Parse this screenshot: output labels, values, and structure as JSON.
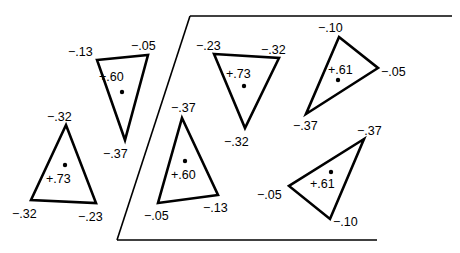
{
  "frame": {
    "top": {
      "x1": 190,
      "y1": 16,
      "x2": 452,
      "y2": 16
    },
    "left": {
      "x1": 190,
      "y1": 16,
      "x2": 117,
      "y2": 240
    },
    "bottom": {
      "x1": 117,
      "y1": 240,
      "x2": 377,
      "y2": 240
    }
  },
  "triangles": [
    {
      "id": "t1",
      "points": "97,60 148,55 125,140",
      "dot": {
        "x": 122,
        "y": 92
      },
      "center_label": {
        "text": "+.60",
        "x": 99,
        "y": 81
      },
      "vertex_labels": [
        {
          "text": "-.13",
          "x": 68,
          "y": 56
        },
        {
          "text": "-.05",
          "x": 131,
          "y": 50
        },
        {
          "text": "-.37",
          "x": 103,
          "y": 158
        }
      ]
    },
    {
      "id": "t2",
      "points": "66,125 31,200 96,203",
      "dot": {
        "x": 65,
        "y": 165
      },
      "center_label": {
        "text": "+.73",
        "x": 46,
        "y": 183
      },
      "vertex_labels": [
        {
          "text": "-.32",
          "x": 47,
          "y": 121
        },
        {
          "text": "-.32",
          "x": 12,
          "y": 218
        },
        {
          "text": "-.23",
          "x": 78,
          "y": 221
        }
      ]
    },
    {
      "id": "t3",
      "points": "214,54 279,58 245,128",
      "dot": {
        "x": 244,
        "y": 86
      },
      "center_label": {
        "text": "+.73",
        "x": 226,
        "y": 78
      },
      "vertex_labels": [
        {
          "text": "-.23",
          "x": 196,
          "y": 50
        },
        {
          "text": "-.32",
          "x": 261,
          "y": 54
        },
        {
          "text": "-.32",
          "x": 224,
          "y": 146
        }
      ]
    },
    {
      "id": "t4",
      "points": "339,37 378,68 306,114",
      "dot": {
        "x": 338,
        "y": 80
      },
      "center_label": {
        "text": "+.61",
        "x": 328,
        "y": 74
      },
      "vertex_labels": [
        {
          "text": "-.10",
          "x": 318,
          "y": 32
        },
        {
          "text": "-.05",
          "x": 381,
          "y": 76
        },
        {
          "text": "-.37",
          "x": 293,
          "y": 130
        }
      ]
    },
    {
      "id": "t5",
      "points": "182,118 218,195 158,203",
      "dot": {
        "x": 185,
        "y": 161
      },
      "center_label": {
        "text": "+.60",
        "x": 171,
        "y": 179
      },
      "vertex_labels": [
        {
          "text": "-.37",
          "x": 171,
          "y": 112
        },
        {
          "text": "-.05",
          "x": 144,
          "y": 220
        },
        {
          "text": "-.13",
          "x": 203,
          "y": 212
        }
      ]
    },
    {
      "id": "t6",
      "points": "364,139 289,186 330,219",
      "dot": {
        "x": 331,
        "y": 172
      },
      "center_label": {
        "text": "+.61",
        "x": 310,
        "y": 188
      },
      "vertex_labels": [
        {
          "text": "-.37",
          "x": 357,
          "y": 135
        },
        {
          "text": "-.05",
          "x": 257,
          "y": 199
        },
        {
          "text": "-.10",
          "x": 333,
          "y": 226
        }
      ]
    }
  ]
}
